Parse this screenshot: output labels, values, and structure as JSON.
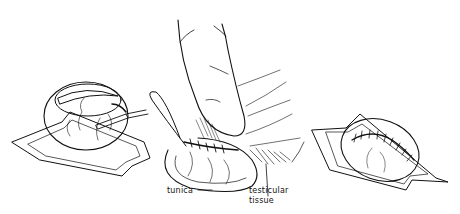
{
  "figure": {
    "panels": [
      {
        "id": "left",
        "description": "tunica incised with scalpel over testis on drape"
      },
      {
        "id": "center",
        "description": "fingers holding testis while tunica is sutured"
      },
      {
        "id": "right",
        "description": "closed tunica with running suture line"
      }
    ],
    "labels": {
      "tunica": "tunica",
      "testicular_line1": "testicular",
      "testicular_line2": "tissue"
    },
    "colors": {
      "ink": "#111111",
      "background": "#ffffff"
    }
  }
}
